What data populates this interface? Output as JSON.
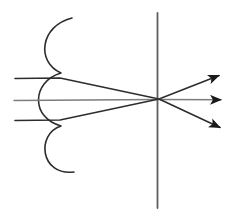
{
  "figure": {
    "name": "ray-diagram",
    "description_labels": {
      "vertical_line": "lens-plane",
      "squiggle": "source-wavefront-curve",
      "convergence_point": "focal-crossing-point"
    },
    "colors": {
      "background": "#ffffff",
      "dark": "#2d2d2d",
      "gray": "#7d7d7d",
      "plane": "#5f5f5f",
      "arrowhead": "#1a1a1a"
    },
    "canvas": {
      "width": 234,
      "height": 220
    },
    "vertical_line": {
      "x1": 157.5,
      "y1": 13,
      "x2": 157.5,
      "y2": 208
    },
    "squiggle": {
      "path": "M72,18 C40,26 36,62 61,73 C31,82 31,118 61,126 C36,134 40,176 74,172"
    },
    "rays_in": [
      {
        "name": "incident-ray-top",
        "path": "M15,78.5 L60,78 L159,99"
      },
      {
        "name": "incident-ray-axis",
        "path": "M14,100.5 L159,99.5"
      },
      {
        "name": "incident-ray-bottom",
        "path": "M15,120.5 L60,120 L159,99"
      }
    ],
    "rays_out": [
      {
        "name": "exit-ray-up",
        "x1": 159,
        "y1": 99,
        "x2": 219,
        "y2": 75.5
      },
      {
        "name": "exit-ray-axis",
        "x1": 159,
        "y1": 99.5,
        "x2": 221,
        "y2": 99.8
      },
      {
        "name": "exit-ray-down",
        "x1": 159,
        "y1": 99,
        "x2": 220,
        "y2": 127.5
      }
    ]
  }
}
